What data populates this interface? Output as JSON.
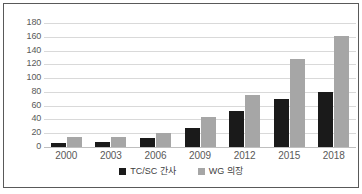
{
  "chart_data": {
    "type": "bar",
    "title": "",
    "subtitle": "",
    "xlabel": "",
    "ylabel": "",
    "categories": [
      "2000",
      "2003",
      "2006",
      "2009",
      "2012",
      "2015",
      "2018"
    ],
    "series": [
      {
        "name": "TC/SC 간사",
        "color": "#1a1a1a",
        "values": [
          6,
          8,
          13,
          27,
          52,
          69,
          80
        ]
      },
      {
        "name": "WG 의장",
        "color": "#a6a6a6",
        "values": [
          14,
          15,
          20,
          43,
          76,
          128,
          161
        ]
      }
    ],
    "ylim": [
      0,
      180
    ],
    "ytick_step": 20,
    "yticks": [
      "180",
      "160",
      "140",
      "120",
      "100",
      "80",
      "60",
      "40",
      "20",
      "0"
    ],
    "grid": true,
    "legend_position": "bottom",
    "annotations": []
  },
  "legend": {
    "items": [
      {
        "label": "TC/SC 간사",
        "swatch": "series-a"
      },
      {
        "label": "WG 의장",
        "swatch": "series-b"
      }
    ]
  },
  "colors": {
    "series_a": "#1a1a1a",
    "series_b": "#a6a6a6",
    "gridline": "#d9d9d9",
    "axis_text": "#595959",
    "border": "#595959"
  }
}
